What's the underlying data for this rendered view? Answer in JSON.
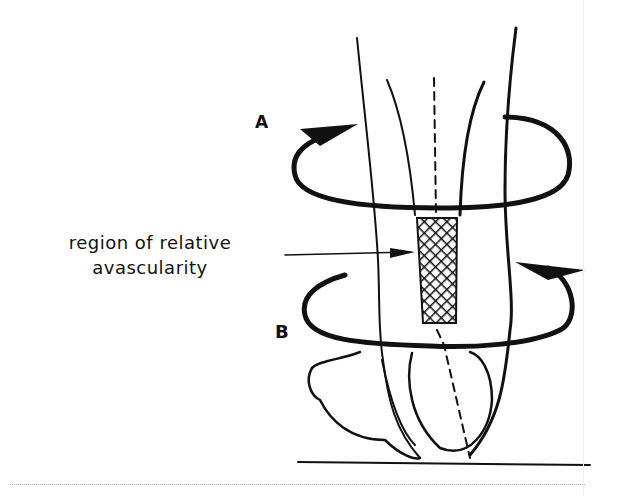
{
  "figure": {
    "labels": {
      "region_line1": "region of relative",
      "region_line2": "avascularity",
      "rotation_a": "A",
      "rotation_b": "B"
    },
    "colors": {
      "ink": "#111111",
      "background": "#ffffff"
    }
  }
}
